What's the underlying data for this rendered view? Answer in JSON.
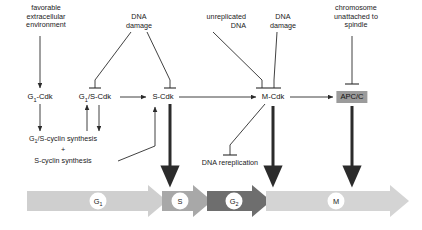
{
  "figure": {
    "type": "diagram"
  },
  "signals": [
    {
      "id": "favorable-environment",
      "text_line1": "favorable",
      "text_line2": "extracellular",
      "text_line3": "environment",
      "x": 46,
      "y": 4,
      "align": "center"
    },
    {
      "id": "dna-damage-g1s",
      "text_line1": "DNA",
      "text_line2": "damage",
      "text_line3": "",
      "x": 139,
      "y": 13,
      "align": "center"
    },
    {
      "id": "unreplicated-dna",
      "text_line1": "unreplicated",
      "text_line2": "DNA",
      "text_line3": "",
      "x": 246,
      "y": 13,
      "align": "right"
    },
    {
      "id": "dna-damage-mcdk",
      "text_line1": "DNA",
      "text_line2": "damage",
      "text_line3": "",
      "x": 283,
      "y": 13,
      "align": "center"
    },
    {
      "id": "chromosome-unattached",
      "text_line1": "chromosome",
      "text_line2": "unattached to",
      "text_line3": "spindle",
      "x": 356,
      "y": 4,
      "align": "center"
    }
  ],
  "nodes": [
    {
      "id": "g1-cdk",
      "label_main": "G",
      "label_sub": "1",
      "label_tail": "-Cdk",
      "x": 40,
      "y": 97,
      "boxed": false
    },
    {
      "id": "g1s-cdk",
      "label_main": "G",
      "label_sub": "1",
      "label_tail": "/S-Cdk",
      "x": 95,
      "y": 97,
      "boxed": false
    },
    {
      "id": "s-cdk",
      "label_main": "S-Cdk",
      "label_sub": "",
      "label_tail": "",
      "x": 163,
      "y": 97,
      "boxed": false
    },
    {
      "id": "m-cdk",
      "label_main": "M-Cdk",
      "label_sub": "",
      "label_tail": "",
      "x": 273,
      "y": 97,
      "boxed": false
    },
    {
      "id": "apc-c",
      "label_main": "APC/C",
      "label_sub": "",
      "label_tail": "",
      "x": 352,
      "y": 97,
      "boxed": true
    }
  ],
  "annotations": [
    {
      "id": "g1s-cyclin-synthesis",
      "main": "G",
      "sub": "1",
      "tail": "/S-cyclin synthesis",
      "x": 63,
      "y": 139
    },
    {
      "id": "plus-sign",
      "main": "+",
      "sub": "",
      "tail": "",
      "x": 63,
      "y": 150
    },
    {
      "id": "s-cyclin-synthesis",
      "main": "S-cyclin synthesis",
      "sub": "",
      "tail": "",
      "x": 63,
      "y": 161
    },
    {
      "id": "dna-rereplication",
      "main": "DNA rereplication",
      "sub": "",
      "tail": "",
      "x": 230,
      "y": 163
    }
  ],
  "phases": [
    {
      "id": "g1-phase",
      "label_main": "G",
      "label_sub": "1",
      "x": 98,
      "y": 201,
      "color": "#cfcfcf"
    },
    {
      "id": "s-phase",
      "label_main": "S",
      "label_sub": "",
      "x": 180,
      "y": 201,
      "color": "#a8a8a8"
    },
    {
      "id": "g2-phase",
      "label_main": "G",
      "label_sub": "2",
      "x": 234,
      "y": 201,
      "color": "#6e6e6e"
    },
    {
      "id": "m-phase",
      "label_main": "M",
      "label_sub": "",
      "x": 336,
      "y": 201,
      "color": "#d4d4d4"
    }
  ],
  "colors": {
    "stroke": "#2b2b2b",
    "box_fill": "#9b9b9b",
    "g1_arrow": "#cfcfcf",
    "s_arrow": "#a8a8a8",
    "g2_arrow": "#6e6e6e",
    "m_arrow": "#d4d4d4",
    "background": "#ffffff"
  }
}
